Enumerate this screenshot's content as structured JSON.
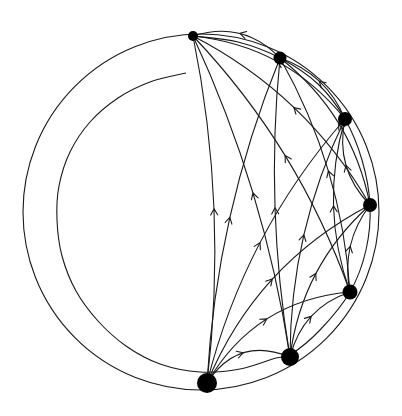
{
  "diagram": {
    "type": "tournament-on-spiral",
    "colors": {
      "stroke": "#1a1a1a",
      "vertex": "#000000",
      "background": "#ffffff"
    },
    "outer_circle": {
      "cx": 201,
      "cy": 212,
      "r": 178
    },
    "spiral": {
      "points": [
        [
          186,
          73
        ],
        [
          150,
          82
        ],
        [
          118,
          98
        ],
        [
          90,
          122
        ],
        [
          70,
          152
        ],
        [
          59,
          186
        ],
        [
          57,
          220
        ],
        [
          62,
          256
        ],
        [
          76,
          291
        ],
        [
          98,
          321
        ],
        [
          126,
          346
        ],
        [
          160,
          364
        ],
        [
          200,
          372
        ],
        [
          240,
          369
        ],
        [
          276,
          358
        ],
        [
          290,
          355
        ],
        [
          320,
          330
        ],
        [
          350,
          292
        ],
        [
          366,
          250
        ],
        [
          370,
          205
        ],
        [
          362,
          160
        ],
        [
          345,
          119
        ],
        [
          318,
          84
        ],
        [
          280,
          58
        ],
        [
          238,
          42
        ],
        [
          193,
          36
        ]
      ]
    },
    "vertices": [
      {
        "id": "v1",
        "x": 207,
        "y": 383,
        "r": 10
      },
      {
        "id": "v2",
        "x": 290,
        "y": 357,
        "r": 9
      },
      {
        "id": "v3",
        "x": 350,
        "y": 292,
        "r": 7.5
      },
      {
        "id": "v4",
        "x": 370,
        "y": 205,
        "r": 7
      },
      {
        "id": "v5",
        "x": 345,
        "y": 119,
        "r": 7
      },
      {
        "id": "v6",
        "x": 280,
        "y": 58,
        "r": 6.5
      },
      {
        "id": "v7",
        "x": 193,
        "y": 36,
        "r": 5
      }
    ],
    "edges": [
      {
        "from": 0,
        "to": 1,
        "bend": -18
      },
      {
        "from": 0,
        "to": 2,
        "bend": -22
      },
      {
        "from": 0,
        "to": 3,
        "bend": -22
      },
      {
        "from": 0,
        "to": 4,
        "bend": -18
      },
      {
        "from": 0,
        "to": 5,
        "bend": -14
      },
      {
        "from": 0,
        "to": 6,
        "bend": 14
      },
      {
        "from": 1,
        "to": 2,
        "bend": -12
      },
      {
        "from": 1,
        "to": 3,
        "bend": -16
      },
      {
        "from": 1,
        "to": 4,
        "bend": -14
      },
      {
        "from": 1,
        "to": 5,
        "bend": -10
      },
      {
        "from": 1,
        "to": 6,
        "bend": 12
      },
      {
        "from": 2,
        "to": 3,
        "bend": -10
      },
      {
        "from": 2,
        "to": 4,
        "bend": -14
      },
      {
        "from": 2,
        "to": 5,
        "bend": 14
      },
      {
        "from": 2,
        "to": 6,
        "bend": 16
      },
      {
        "from": 3,
        "to": 4,
        "bend": -12
      },
      {
        "from": 3,
        "to": 5,
        "bend": 16
      },
      {
        "from": 3,
        "to": 6,
        "bend": 18
      },
      {
        "from": 4,
        "to": 5,
        "bend": 10
      },
      {
        "from": 4,
        "to": 6,
        "bend": 18
      },
      {
        "from": 5,
        "to": 6,
        "bend": 14
      }
    ]
  }
}
